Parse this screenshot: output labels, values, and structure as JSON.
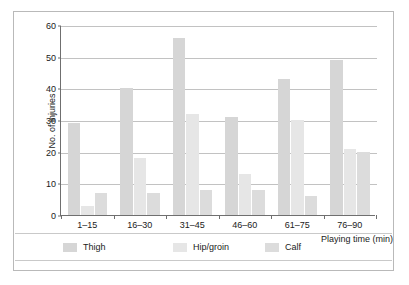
{
  "chart_data": {
    "type": "bar",
    "title": "",
    "xlabel": "Playing time (min)",
    "ylabel": "No. of injuries",
    "categories": [
      "1–15",
      "16–30",
      "31–45",
      "46–60",
      "61–75",
      "76–90"
    ],
    "series": [
      {
        "name": "Thigh",
        "values": [
          29,
          40,
          56,
          31,
          43,
          49
        ],
        "color": "#d6d6d6"
      },
      {
        "name": "Hip/groin",
        "values": [
          3,
          18,
          32,
          13,
          30,
          21
        ],
        "color": "#e6e6e6"
      },
      {
        "name": "Calf",
        "values": [
          7,
          7,
          8,
          8,
          6,
          20
        ],
        "color": "#dcdcdc"
      }
    ],
    "ylim": [
      0,
      60
    ],
    "yticks": [
      0,
      10,
      20,
      30,
      40,
      50,
      60
    ],
    "ytick_labels": [
      "0",
      "10",
      "20",
      "30",
      "40",
      "50",
      "60"
    ],
    "grid": true,
    "legend_position": "bottom"
  },
  "legend": {
    "items": [
      {
        "label": "Thigh"
      },
      {
        "label": "Hip/groin"
      },
      {
        "label": "Calf"
      }
    ]
  },
  "axes": {
    "y_title": "No. of injuries",
    "x_title": "Playing time (min)"
  }
}
